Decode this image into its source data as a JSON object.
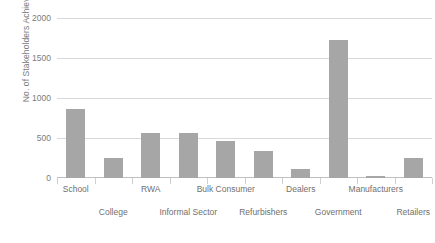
{
  "chart_data": {
    "type": "bar",
    "title": "",
    "xlabel": "",
    "ylabel": "No. of Stakeholders Achieved",
    "categories": [
      "School",
      "College",
      "RWA",
      "Informal Sector",
      "Bulk Consumer",
      "Refurbishers",
      "Dealers",
      "Government",
      "Manufacturers",
      "Retailers"
    ],
    "values": [
      860,
      250,
      560,
      560,
      460,
      340,
      115,
      1730,
      20,
      250
    ],
    "series": [
      {
        "name": "No. of Stakeholders Achieved",
        "values": [
          860,
          250,
          560,
          560,
          460,
          340,
          115,
          1730,
          20,
          250
        ]
      }
    ],
    "ylim": [
      0,
      2000
    ],
    "yticks": [
      0,
      500,
      1000,
      1500,
      2000
    ],
    "ytick_labels": [
      "0",
      "500",
      "1000",
      "1500",
      "2000"
    ],
    "grid": "horizontal",
    "legend": "none",
    "bar_color": "#a6a6a6",
    "gridline_color": "#d9d9d9",
    "text_color": "#6f6f6f",
    "label_rows": [
      {
        "row": 1,
        "labels": [
          "School",
          "RWA",
          "Bulk Consumer",
          "Dealers",
          "Manufacturers"
        ]
      },
      {
        "row": 2,
        "labels": [
          "College",
          "Informal Sector",
          "Refurbishers",
          "Government",
          "Retailers"
        ]
      }
    ]
  }
}
